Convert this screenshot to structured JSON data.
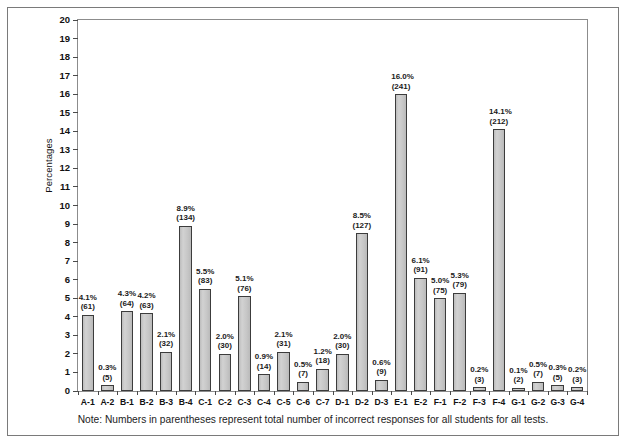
{
  "figure": {
    "note": "Note: Numbers in parentheses represent total number of incorrect responses for all students for all tests.",
    "top_caption": ""
  },
  "chart_data": {
    "type": "bar",
    "title": "",
    "xlabel": "",
    "ylabel": "Percentages",
    "ylim": [
      0,
      20
    ],
    "ytick_step": 1,
    "grid": false,
    "legend": null,
    "bar_color": "#c9c9c9",
    "bar_edge_color": "#3c3c3c",
    "yticks": [
      20,
      19,
      18,
      17,
      16,
      15,
      14,
      13,
      12,
      11,
      10,
      9,
      8,
      7,
      6,
      5,
      4,
      3,
      2,
      1,
      0
    ],
    "categories": [
      "A-1",
      "A-2",
      "B-1",
      "B-2",
      "B-3",
      "B-4",
      "C-1",
      "C-2",
      "C-3",
      "C-4",
      "C-5",
      "C-6",
      "C-7",
      "D-1",
      "D-2",
      "D-3",
      "E-1",
      "E-2",
      "F-1",
      "F-2",
      "F-3",
      "F-4",
      "G-1",
      "G-2",
      "G-3",
      "G-4"
    ],
    "values": [
      4.1,
      0.3,
      4.3,
      4.2,
      2.1,
      8.9,
      5.5,
      2.0,
      5.1,
      0.9,
      2.1,
      0.5,
      1.2,
      2.0,
      8.5,
      0.6,
      16.0,
      6.1,
      5.0,
      5.3,
      0.2,
      14.1,
      0.1,
      0.5,
      0.3,
      0.2
    ],
    "counts": [
      61,
      5,
      64,
      63,
      32,
      134,
      83,
      30,
      76,
      14,
      31,
      7,
      18,
      30,
      127,
      9,
      241,
      91,
      75,
      79,
      3,
      212,
      2,
      7,
      5,
      3
    ],
    "percent_labels": [
      "4.1%",
      "0.3%",
      "4.3%",
      "4.2%",
      "2.1%",
      "8.9%",
      "5.5%",
      "2.0%",
      "5.1%",
      "0.9%",
      "2.1%",
      "0.5%",
      "1.2%",
      "2.0%",
      "8.5%",
      "0.6%",
      "16.0%",
      "6.1%",
      "5.0%",
      "5.3%",
      "0.2%",
      "14.1%",
      "0.1%",
      "0.5%",
      "0.3%",
      "0.2%"
    ],
    "count_labels": [
      "(61)",
      "(5)",
      "(64)",
      "(63)",
      "(32)",
      "(134)",
      "(83)",
      "(30)",
      "(76)",
      "(14)",
      "(31)",
      "(7)",
      "(18)",
      "(30)",
      "(127)",
      "(9)",
      "(241)",
      "(91)",
      "(75)",
      "(79)",
      "(3)",
      "(212)",
      "(2)",
      "(7)",
      "(5)",
      "(3)"
    ]
  }
}
